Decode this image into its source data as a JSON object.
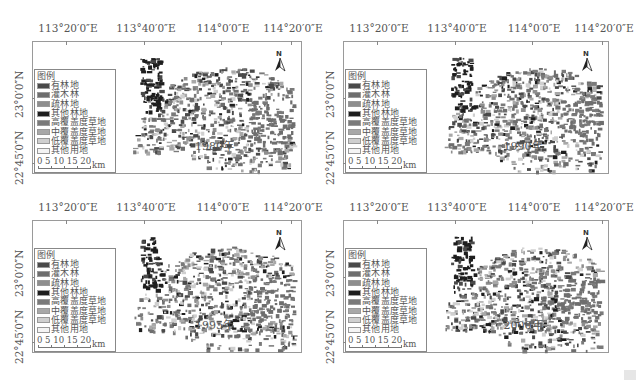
{
  "figure": {
    "panels": [
      {
        "id": "p1980",
        "year_label": "1980年",
        "left": 0,
        "top": 0,
        "frame": {
          "x": 32,
          "y": 41,
          "w": 270,
          "h": 133
        }
      },
      {
        "id": "p1990",
        "year_label": "1990年",
        "left": 311,
        "top": 0,
        "frame": {
          "x": 32,
          "y": 41,
          "w": 266,
          "h": 133
        }
      },
      {
        "id": "p1995",
        "year_label": "1995年",
        "left": 0,
        "top": 179,
        "frame": {
          "x": 32,
          "y": 41,
          "w": 270,
          "h": 133
        }
      },
      {
        "id": "p2000",
        "year_label": "2000年",
        "left": 311,
        "top": 179,
        "frame": {
          "x": 32,
          "y": 41,
          "w": 266,
          "h": 133
        }
      }
    ],
    "longitude_labels": [
      "113°20′0″E",
      "113°40′0″E",
      "114°0′0″E",
      "114°20′0″E"
    ],
    "latitude_labels": [
      "23°0′0″N",
      "22°45′0″N"
    ],
    "north_arrow_label": "N",
    "legend": {
      "title": "图例",
      "items": [
        {
          "label": "有林地",
          "color": "#4a4a4a"
        },
        {
          "label": "灌木林",
          "color": "#6e6e6e"
        },
        {
          "label": "疏林地",
          "color": "#8e8e8e"
        },
        {
          "label": "其他林地",
          "color": "#1e1e1e"
        },
        {
          "label": "高覆盖度草地",
          "color": "#7a7a7a"
        },
        {
          "label": "中覆盖度草地",
          "color": "#a8a8a8"
        },
        {
          "label": "低覆盖度草地",
          "color": "#cfcfcf"
        },
        {
          "label": "其他用地",
          "color": "#f4f4f4"
        }
      ],
      "scale_numbers": "0  5  10 15 20",
      "scale_unit": "km"
    }
  }
}
